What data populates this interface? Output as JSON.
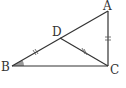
{
  "diagram": {
    "type": "geometry-triangle",
    "points": {
      "A": {
        "label": "A",
        "x": 108,
        "y": 11
      },
      "B": {
        "label": "B",
        "x": 12,
        "y": 66
      },
      "C": {
        "label": "C",
        "x": 108,
        "y": 66
      },
      "D": {
        "label": "D",
        "x": 60,
        "y": 38
      }
    },
    "segments": [
      "AB",
      "BC",
      "AC",
      "DC"
    ],
    "equal_marks": [
      "BD",
      "DC",
      "AC"
    ],
    "angle_marked": "B",
    "colors": {
      "stroke": "#333333",
      "angle_fill": "#999999"
    }
  }
}
